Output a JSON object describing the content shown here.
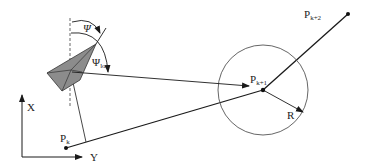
{
  "diagram": {
    "labels": {
      "psi": "Ψ",
      "psi_los": "Ψ",
      "psi_los_sub": "los",
      "pk": "P",
      "pk_sub": "k",
      "pk1": "P",
      "pk1_sub": "k+1",
      "pk2": "P",
      "pk2_sub": "k+2",
      "radius": "R",
      "axis_x": "X",
      "axis_y": "Y"
    },
    "points": {
      "pk": [
        66,
        148
      ],
      "pk1": [
        263,
        90
      ],
      "pk2": [
        348,
        14
      ]
    },
    "circle": {
      "cx": 263,
      "cy": 90,
      "r": 45
    },
    "colors": {
      "line": "#1a1a1a",
      "vessel_fill": "#8c8c8c",
      "vessel_stroke": "#333333",
      "circle": "#555555",
      "dashed": "#555555"
    }
  }
}
